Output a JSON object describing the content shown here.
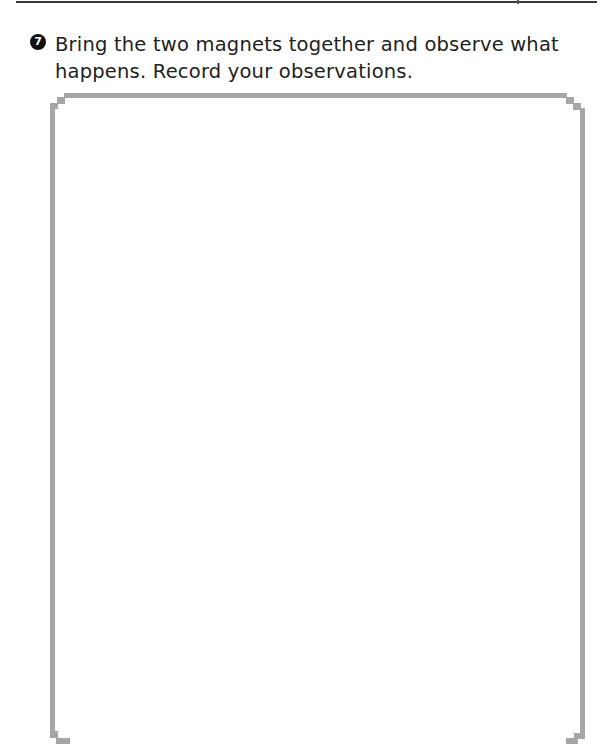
{
  "header": {
    "rule": true
  },
  "question": {
    "number": "7",
    "number_icon": "filled-circle-number-icon",
    "text": "Bring the two magnets together and observe what happens. Record your observations."
  },
  "answer_box": {
    "value": "",
    "border_color": "#a6a6a6"
  }
}
